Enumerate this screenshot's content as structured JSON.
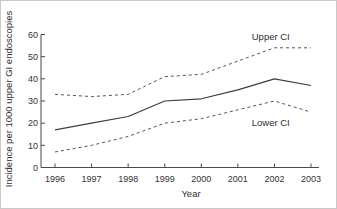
{
  "figure": {
    "background": "#ffffff",
    "border_color": "#c9c9c9",
    "axis_color": "#4a4a4a",
    "line_color": "#3d3d3d",
    "text_color": "#2e2e2e"
  },
  "chart_data": {
    "type": "line",
    "title": "",
    "xlabel": "Year",
    "ylabel": "Incidence per 1000 upper GI endoscopies",
    "x": [
      1996,
      1997,
      1998,
      1999,
      2000,
      2001,
      2002,
      2003
    ],
    "ylim": [
      0,
      60
    ],
    "yticks": [
      0,
      10,
      20,
      30,
      40,
      50,
      60
    ],
    "grid": false,
    "legend_position": "none",
    "series": [
      {
        "name": "Upper CI",
        "style": "dashed",
        "values": [
          33,
          32,
          33,
          41,
          42,
          48,
          54,
          54
        ]
      },
      {
        "name": "Incidence",
        "style": "solid",
        "values": [
          17,
          20,
          23,
          30,
          31,
          35,
          40,
          37
        ]
      },
      {
        "name": "Lower CI",
        "style": "dashed",
        "values": [
          7,
          10,
          14,
          20,
          22,
          26,
          30,
          25
        ]
      }
    ],
    "annotations": [
      {
        "text": "Upper CI",
        "x": 2001.9,
        "y": 59
      },
      {
        "text": "Lower CI",
        "x": 2001.9,
        "y": 20
      }
    ]
  }
}
